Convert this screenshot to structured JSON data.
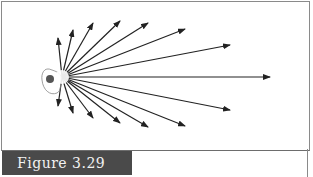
{
  "figure": {
    "caption": "Figure 3.29",
    "caption_bar_color": "#4a4a4a",
    "caption_text_color": "#f2f2f2",
    "line_color": "#222222"
  },
  "diagram": {
    "origin": [
      62,
      77
    ],
    "arrow_tips": [
      [
        58,
        38
      ],
      [
        73,
        30
      ],
      [
        93,
        23
      ],
      [
        120,
        21
      ],
      [
        148,
        23
      ],
      [
        185,
        29
      ],
      [
        230,
        45
      ],
      [
        270,
        77
      ],
      [
        230,
        110
      ],
      [
        185,
        126
      ],
      [
        148,
        127
      ],
      [
        120,
        123
      ],
      [
        93,
        118
      ],
      [
        73,
        113
      ],
      [
        58,
        106
      ]
    ]
  }
}
